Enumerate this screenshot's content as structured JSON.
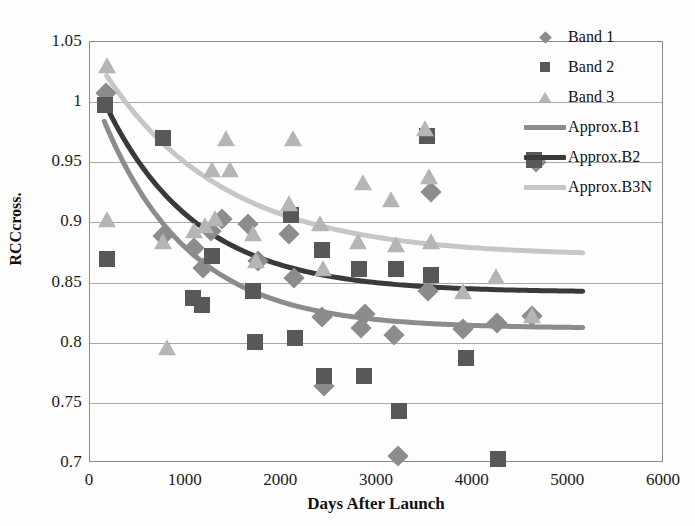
{
  "chart_data": {
    "type": "scatter",
    "title": "",
    "xlabel": "Days After Launch",
    "ylabel": "RCCcross.",
    "xlim": [
      0,
      6000
    ],
    "ylim": [
      0.7,
      1.05
    ],
    "xticks": [
      "0",
      "1000",
      "2000",
      "3000",
      "4000",
      "5000",
      "6000"
    ],
    "xtick_values": [
      0,
      1000,
      2000,
      3000,
      4000,
      5000,
      6000
    ],
    "yticks": [
      "0.7",
      "0.75",
      "0.8",
      "0.85",
      "0.9",
      "0.95",
      "1",
      "1.05"
    ],
    "ytick_values": [
      0.7,
      0.75,
      0.8,
      0.85,
      0.9,
      0.95,
      1.0,
      1.05
    ],
    "grid": true,
    "legend_position": "top-right",
    "colors": {
      "band1": "#8c8c8c",
      "band2": "#585858",
      "band3": "#b5b5b5",
      "approx_b1": "#8c8c8c",
      "approx_b2": "#3a3a3a",
      "approx_b3n": "#c6c6c6",
      "grid": "#a8a8a8",
      "frame": "#8a8a8a",
      "text": "#111111"
    },
    "series": [
      {
        "name": "Band 1",
        "marker": "diamond",
        "color": "#8c8c8c",
        "points": [
          [
            170,
            1.008
          ],
          [
            760,
            0.889
          ],
          [
            1090,
            0.879
          ],
          [
            1180,
            0.862
          ],
          [
            1270,
            0.893
          ],
          [
            1380,
            0.903
          ],
          [
            1650,
            0.899
          ],
          [
            1760,
            0.868
          ],
          [
            2080,
            0.89
          ],
          [
            2130,
            0.854
          ],
          [
            2420,
            0.821
          ],
          [
            2450,
            0.764
          ],
          [
            2830,
            0.812
          ],
          [
            2870,
            0.824
          ],
          [
            3180,
            0.806
          ],
          [
            3220,
            0.706
          ],
          [
            3530,
            0.843
          ],
          [
            3560,
            0.925
          ],
          [
            3900,
            0.811
          ],
          [
            4250,
            0.816
          ],
          [
            4620,
            0.822
          ],
          [
            4660,
            0.95
          ]
        ]
      },
      {
        "name": "Band 2",
        "marker": "square",
        "color": "#585858",
        "points": [
          [
            160,
            0.998
          ],
          [
            180,
            0.87
          ],
          [
            760,
            0.97
          ],
          [
            1080,
            0.837
          ],
          [
            1170,
            0.831
          ],
          [
            1280,
            0.872
          ],
          [
            1700,
            0.843
          ],
          [
            1720,
            0.801
          ],
          [
            2100,
            0.906
          ],
          [
            2140,
            0.804
          ],
          [
            2420,
            0.877
          ],
          [
            2450,
            0.772
          ],
          [
            2810,
            0.861
          ],
          [
            2860,
            0.772
          ],
          [
            3200,
            0.861
          ],
          [
            3230,
            0.743
          ],
          [
            3520,
            0.972
          ],
          [
            3560,
            0.856
          ],
          [
            3930,
            0.787
          ],
          [
            4270,
            0.703
          ],
          [
            4640,
            0.952
          ]
        ]
      },
      {
        "name": "Band 3",
        "marker": "triangle",
        "color": "#b5b5b5",
        "points": [
          [
            175,
            1.03
          ],
          [
            180,
            0.902
          ],
          [
            760,
            0.884
          ],
          [
            800,
            0.796
          ],
          [
            1090,
            0.893
          ],
          [
            1200,
            0.897
          ],
          [
            1280,
            0.944
          ],
          [
            1310,
            0.903
          ],
          [
            1420,
            0.969
          ],
          [
            1460,
            0.944
          ],
          [
            1700,
            0.89
          ],
          [
            1740,
            0.868
          ],
          [
            2080,
            0.915
          ],
          [
            2120,
            0.969
          ],
          [
            2400,
            0.899
          ],
          [
            2440,
            0.861
          ],
          [
            2800,
            0.884
          ],
          [
            2850,
            0.933
          ],
          [
            3150,
            0.919
          ],
          [
            3200,
            0.881
          ],
          [
            3500,
            0.978
          ],
          [
            3540,
            0.938
          ],
          [
            3560,
            0.884
          ],
          [
            3900,
            0.842
          ],
          [
            4240,
            0.855
          ],
          [
            4620,
            0.822
          ]
        ]
      }
    ],
    "fits": [
      {
        "name": "Approx.B1",
        "color": "#8c8c8c",
        "x_start": 150,
        "x_end": 5150,
        "asymptote": 0.812,
        "y_start": 0.984,
        "decay": 900
      },
      {
        "name": "Approx.B2",
        "color": "#3a3a3a",
        "x_start": 150,
        "x_end": 5150,
        "asymptote": 0.842,
        "y_start": 1.0,
        "decay": 950
      },
      {
        "name": "Approx.B3N",
        "color": "#c6c6c6",
        "x_start": 175,
        "x_end": 5150,
        "asymptote": 0.872,
        "y_start": 1.022,
        "decay": 1250
      }
    ]
  },
  "legend": {
    "items": [
      {
        "label": "Band 1",
        "key": "diamond",
        "color": "#8c8c8c"
      },
      {
        "label": "Band 2",
        "key": "square",
        "color": "#585858"
      },
      {
        "label": "Band 3",
        "key": "triangle",
        "color": "#b5b5b5"
      },
      {
        "label": "Approx.B1",
        "key": "line",
        "color": "#8c8c8c"
      },
      {
        "label": "Approx.B2",
        "key": "line",
        "color": "#3a3a3a"
      },
      {
        "label": "Approx.B3N",
        "key": "line",
        "color": "#c6c6c6"
      }
    ]
  }
}
